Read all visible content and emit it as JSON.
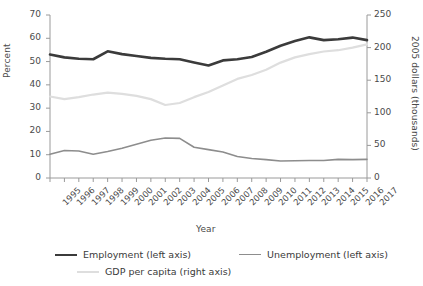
{
  "chart_data": {
    "type": "line",
    "title": "",
    "xlabel": "Year",
    "ylabel_left": "Percent",
    "ylabel_right": "2005 dollars (thousands)",
    "categories": [
      "1995",
      "1996",
      "1997",
      "1998",
      "1999",
      "2000",
      "2001",
      "2002",
      "2003",
      "2004",
      "2005",
      "2006",
      "2007",
      "2008",
      "2009",
      "2010",
      "2011",
      "2012",
      "2013",
      "2014",
      "2015",
      "2016",
      "2017"
    ],
    "ylim_left": [
      0,
      70
    ],
    "ylim_right": [
      0,
      250
    ],
    "yticks_left": [
      0,
      10,
      20,
      30,
      40,
      50,
      60,
      70
    ],
    "yticks_right": [
      0,
      50,
      100,
      150,
      200,
      250
    ],
    "grid": false,
    "legend_position": "bottom",
    "series": [
      {
        "name": "Employment (left axis)",
        "axis": "left",
        "color": "#3b3b3b",
        "width": 2.6,
        "values": [
          53.0,
          51.8,
          51.2,
          51.0,
          54.4,
          53.2,
          52.4,
          51.6,
          51.2,
          51.0,
          49.6,
          48.3,
          50.5,
          51.0,
          52.0,
          54.2,
          56.8,
          58.8,
          60.4,
          59.2,
          59.6,
          60.3,
          59.2
        ]
      },
      {
        "name": "Unemployment (left axis)",
        "axis": "left",
        "color": "#8d8d8d",
        "width": 1.6,
        "values": [
          10.2,
          11.8,
          11.6,
          10.2,
          11.4,
          12.8,
          14.5,
          16.2,
          17.2,
          17.0,
          13.2,
          12.2,
          11.2,
          9.2,
          8.4,
          7.9,
          7.3,
          7.4,
          7.5,
          7.5,
          8.0,
          7.9,
          8.0
        ]
      },
      {
        "name": "GDP per capita (right axis)",
        "axis": "right",
        "color": "#dedede",
        "width": 2.2,
        "values": [
          125,
          121,
          124,
          128,
          131,
          129,
          126,
          121,
          112,
          115,
          124,
          132,
          142,
          152,
          158,
          166,
          177,
          185,
          190,
          194,
          196,
          200,
          205
        ]
      }
    ]
  },
  "legend": {
    "employment": "Employment (left axis)",
    "unemployment": "Unemployment (left axis)",
    "gdp": "GDP per capita (right axis)"
  }
}
